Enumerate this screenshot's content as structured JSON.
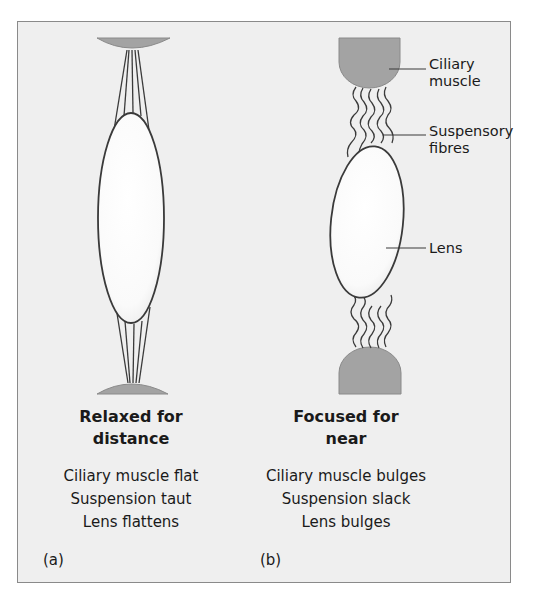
{
  "labels": {
    "ciliary": [
      "Ciliary",
      "muscle"
    ],
    "fibres": [
      "Suspensory",
      "fibres"
    ],
    "lens": "Lens"
  },
  "panel_a": {
    "letter": "(a)",
    "title": [
      "Relaxed for",
      "distance"
    ],
    "description": [
      "Ciliary muscle flat",
      "Suspension taut",
      "Lens flattens"
    ]
  },
  "panel_b": {
    "letter": "(b)",
    "title": [
      "Focused for",
      "near"
    ],
    "description": [
      "Ciliary muscle bulges",
      "Suspension slack",
      "Lens bulges"
    ]
  },
  "colors": {
    "background": "#efefef",
    "muscle": "#a3a3a3",
    "lens": "#ffffff",
    "outline": "#3a3a3a"
  }
}
